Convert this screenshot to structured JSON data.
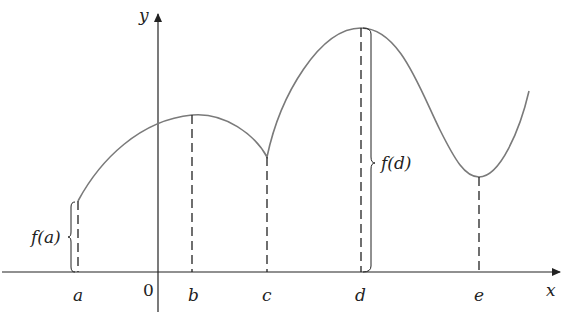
{
  "diagram": {
    "axes": {
      "x_label": "x",
      "y_label": "y",
      "origin_label": "0"
    },
    "points": [
      {
        "label": "a",
        "x": 78,
        "fy": 201
      },
      {
        "label": "b",
        "x": 192,
        "fy": 115
      },
      {
        "label": "c",
        "x": 267,
        "fy": 157
      },
      {
        "label": "d",
        "x": 361,
        "fy": 28
      },
      {
        "label": "e",
        "x": 479,
        "fy": 177
      }
    ],
    "annotations": {
      "fa": "f(a)",
      "fd": "f(d)"
    },
    "colors": {
      "curve": "#7a7a7a",
      "axes": "#222222",
      "dash": "#222222"
    }
  }
}
